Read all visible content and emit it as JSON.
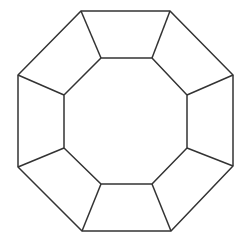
{
  "diagram": {
    "type": "concentric-octagons",
    "canvas": {
      "width": 251,
      "height": 239,
      "background": "#ffffff"
    },
    "stroke_color": "#333333",
    "stroke_width": 1.5,
    "outer_octagon": [
      [
        81,
        11
      ],
      [
        170,
        11
      ],
      [
        233,
        75
      ],
      [
        233,
        166
      ],
      [
        171,
        231
      ],
      [
        82,
        231
      ],
      [
        18,
        167
      ],
      [
        18,
        75
      ]
    ],
    "inner_octagon": [
      [
        101,
        58
      ],
      [
        152,
        58
      ],
      [
        187,
        95
      ],
      [
        187,
        148
      ],
      [
        152,
        184
      ],
      [
        101,
        184
      ],
      [
        64,
        148
      ],
      [
        64,
        95
      ]
    ],
    "spokes_count": 8
  }
}
